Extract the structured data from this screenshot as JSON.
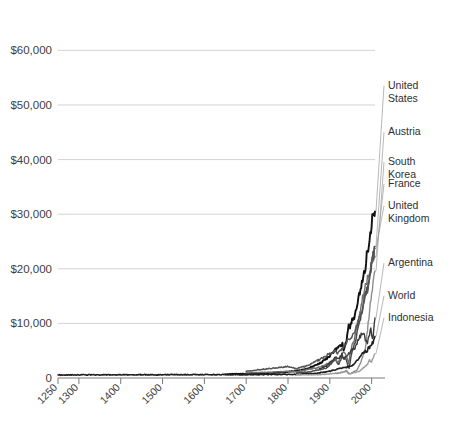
{
  "chart_data": {
    "type": "line",
    "title": "",
    "subtitle": "",
    "xlabel": "",
    "ylabel": "",
    "xlim": [
      1250,
      2008
    ],
    "ylim": [
      0,
      63000
    ],
    "grid": true,
    "grid_axis": "y",
    "legend_position": "right-inline-labels",
    "y_ticks": [
      0,
      10000,
      20000,
      30000,
      40000,
      50000,
      60000
    ],
    "y_ticklabels": [
      "0",
      "$10,000",
      "$20,000",
      "$30,000",
      "$40,000",
      "$50,000",
      "$60,000"
    ],
    "x_ticks": [
      1250,
      1300,
      1400,
      1500,
      1600,
      1700,
      1800,
      1900,
      2000
    ],
    "x_ticklabels": [
      "1250",
      "1300",
      "1400",
      "1500",
      "1600",
      "1700",
      "1800",
      "1900",
      "2000"
    ],
    "series": [
      {
        "name": "United States",
        "color": "#111111",
        "width": 1.9,
        "label_anchor": [
          2005,
          53000
        ],
        "x": [
          1650,
          1700,
          1750,
          1790,
          1800,
          1820,
          1840,
          1850,
          1860,
          1870,
          1880,
          1890,
          1900,
          1910,
          1920,
          1930,
          1933,
          1940,
          1945,
          1950,
          1955,
          1960,
          1965,
          1970,
          1975,
          1980,
          1985,
          1990,
          1995,
          2000,
          2003,
          2006,
          2008
        ],
        "values": [
          700,
          750,
          900,
          1050,
          1150,
          1300,
          1550,
          1800,
          2150,
          2450,
          2900,
          3400,
          4100,
          4950,
          5550,
          6200,
          4900,
          6800,
          9500,
          9560,
          11000,
          11330,
          13400,
          15030,
          16280,
          18580,
          20400,
          23200,
          25500,
          28500,
          29000,
          31200,
          30500
        ]
      },
      {
        "name": "Austria",
        "color": "#4a4a4a",
        "width": 1.5,
        "label_anchor": [
          2005,
          44500
        ],
        "x": [
          1820,
          1850,
          1870,
          1890,
          1900,
          1913,
          1920,
          1929,
          1938,
          1946,
          1950,
          1960,
          1970,
          1980,
          1990,
          2000,
          2008
        ],
        "values": [
          950,
          1100,
          1450,
          1800,
          2350,
          3460,
          2400,
          3700,
          3600,
          1700,
          3700,
          6500,
          9750,
          13760,
          16900,
          20700,
          24100
        ]
      },
      {
        "name": "South Korea",
        "color": "#8e8e8e",
        "width": 1.4,
        "label_anchor": [
          2005,
          39000
        ],
        "x": [
          1911,
          1920,
          1930,
          1940,
          1945,
          1950,
          1955,
          1960,
          1965,
          1970,
          1975,
          1980,
          1985,
          1990,
          1995,
          2000,
          2008
        ],
        "values": [
          815,
          900,
          1000,
          1400,
          900,
          770,
          1050,
          1230,
          1440,
          2160,
          3160,
          4100,
          5670,
          8700,
          12000,
          15700,
          19600
        ]
      },
      {
        "name": "France",
        "color": "#6f6f6f",
        "width": 1.4,
        "label_anchor": [
          2005,
          35000
        ],
        "x": [
          1700,
          1750,
          1800,
          1820,
          1850,
          1870,
          1890,
          1900,
          1913,
          1920,
          1930,
          1938,
          1945,
          1950,
          1960,
          1970,
          1980,
          1990,
          2000,
          2008
        ],
        "values": [
          910,
          1050,
          1200,
          1135,
          1597,
          1876,
          2376,
          2876,
          3485,
          2855,
          4532,
          4466,
          2573,
          5186,
          7398,
          11664,
          15106,
          18093,
          21400,
          22200
        ]
      },
      {
        "name": "United Kingdom",
        "color": "#555555",
        "width": 1.5,
        "label_anchor": [
          2005,
          31000
        ],
        "x": [
          1700,
          1750,
          1800,
          1820,
          1850,
          1870,
          1890,
          1900,
          1913,
          1920,
          1930,
          1938,
          1945,
          1950,
          1960,
          1970,
          1980,
          1990,
          2000,
          2008
        ],
        "values": [
          1250,
          1695,
          2080,
          1706,
          2330,
          3190,
          4009,
          4492,
          4921,
          4548,
          5441,
          6266,
          7056,
          6939,
          8645,
          10767,
          12931,
          16430,
          20400,
          23700
        ]
      },
      {
        "name": "Argentina",
        "color": "#3a3a3a",
        "width": 1.4,
        "label_anchor": [
          2005,
          20500
        ],
        "x": [
          1875,
          1890,
          1900,
          1913,
          1920,
          1929,
          1932,
          1940,
          1945,
          1950,
          1960,
          1970,
          1975,
          1980,
          1985,
          1990,
          1995,
          1998,
          2002,
          2005,
          2008
        ],
        "values": [
          1700,
          2150,
          2756,
          3797,
          3473,
          4367,
          3491,
          4161,
          4483,
          4987,
          5559,
          7302,
          7970,
          8206,
          6930,
          6433,
          8125,
          9160,
          6900,
          8800,
          10995
        ]
      },
      {
        "name": "World",
        "color": "#1f1f1f",
        "width": 1.6,
        "label_anchor": [
          2005,
          14500
        ],
        "x": [
          1250,
          1300,
          1400,
          1500,
          1600,
          1700,
          1820,
          1870,
          1900,
          1913,
          1940,
          1950,
          1960,
          1970,
          1980,
          1990,
          2000,
          2008
        ],
        "values": [
          560,
          570,
          580,
          600,
          620,
          615,
          667,
          870,
          1261,
          1526,
          2000,
          2111,
          2773,
          3729,
          4511,
          5150,
          6038,
          7614
        ]
      },
      {
        "name": "Indonesia",
        "color": "#9a9a9a",
        "width": 1.3,
        "label_anchor": [
          2005,
          10500
        ],
        "x": [
          1820,
          1870,
          1900,
          1913,
          1920,
          1930,
          1940,
          1945,
          1950,
          1960,
          1970,
          1975,
          1980,
          1985,
          1990,
          1995,
          1998,
          2000,
          2008
        ],
        "values": [
          612,
          578,
          745,
          874,
          850,
          1100,
          1150,
          700,
          840,
          1019,
          1194,
          1504,
          1870,
          2110,
          2514,
          3250,
          2950,
          3041,
          4428
        ]
      }
    ],
    "annotations": [
      {
        "text": "United States",
        "lines": [
          "United",
          "States"
        ]
      },
      {
        "text": "Austria",
        "lines": [
          "Austria"
        ]
      },
      {
        "text": "South Korea",
        "lines": [
          "South",
          "Korea"
        ]
      },
      {
        "text": "France",
        "lines": [
          "France"
        ]
      },
      {
        "text": "United Kingdom",
        "lines": [
          "United",
          "Kingdom"
        ]
      },
      {
        "text": "Argentina",
        "lines": [
          "Argentina"
        ]
      },
      {
        "text": "World",
        "lines": [
          "World"
        ]
      },
      {
        "text": "Indonesia",
        "lines": [
          "Indonesia"
        ]
      }
    ]
  },
  "colors": {
    "background": "#ffffff",
    "gridline": "#cfcfcf",
    "axis": "#7a7a7a",
    "text": "#3a3a3a",
    "leader": "#999999"
  }
}
